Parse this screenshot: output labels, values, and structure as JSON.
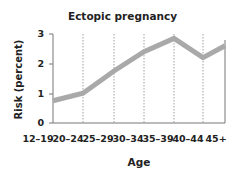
{
  "chart_data": {
    "type": "line",
    "title": "Ectopic pregnancy",
    "xlabel": "Age",
    "ylabel": "Risk (percent)",
    "categories": [
      "12–19",
      "20–24",
      "25–29",
      "30–34",
      "35–39",
      "40–44",
      "45+"
    ],
    "series": [
      {
        "name": "Ectopic pregnancy risk",
        "values": [
          0.75,
          1.0,
          1.75,
          2.4,
          2.85,
          2.2,
          2.6
        ]
      }
    ],
    "ylim": [
      0,
      3
    ],
    "yticks": [
      "0",
      "1",
      "2",
      "3"
    ],
    "grid": "vertical dotted lines at category boundaries",
    "legend": "none",
    "line_color": "#a9a9a9"
  }
}
